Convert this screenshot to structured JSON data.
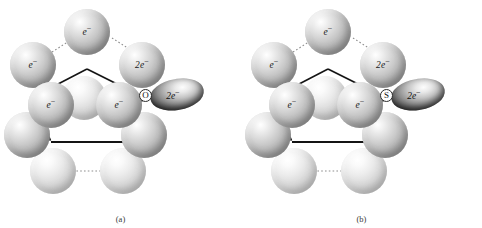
{
  "figure": {
    "panels": [
      {
        "id": "a",
        "caption": "(a)",
        "adsorbate_symbol": "O",
        "lobe_label": "2e",
        "lobe_charge": "−",
        "spheres": [
          {
            "name": "top",
            "label": "e",
            "charge": "−",
            "x": 64,
            "y": 9,
            "d": 46,
            "pale": false
          },
          {
            "name": "upper-left",
            "label": "e",
            "charge": "−",
            "x": 10,
            "y": 42,
            "d": 46,
            "pale": false
          },
          {
            "name": "upper-right",
            "label": "2e",
            "charge": "−",
            "x": 119,
            "y": 42,
            "d": 46,
            "pale": false
          },
          {
            "name": "inner-center",
            "label": "",
            "charge": "",
            "x": 62,
            "y": 76,
            "d": 44,
            "pale": true
          },
          {
            "name": "inner-left",
            "label": "e",
            "charge": "−",
            "x": 28,
            "y": 82,
            "d": 46,
            "pale": false
          },
          {
            "name": "inner-right",
            "label": "e",
            "charge": "−",
            "x": 96,
            "y": 82,
            "d": 46,
            "pale": false
          },
          {
            "name": "lower-left",
            "label": "",
            "charge": "",
            "x": 4,
            "y": 112,
            "d": 46,
            "pale": false
          },
          {
            "name": "lower-right",
            "label": "",
            "charge": "",
            "x": 121,
            "y": 112,
            "d": 46,
            "pale": false
          },
          {
            "name": "bottom-left",
            "label": "",
            "charge": "",
            "x": 30,
            "y": 148,
            "d": 46,
            "pale": true
          },
          {
            "name": "bottom-right",
            "label": "",
            "charge": "",
            "x": 100,
            "y": 148,
            "d": 46,
            "pale": true
          }
        ]
      },
      {
        "id": "b",
        "caption": "(b)",
        "adsorbate_symbol": "S",
        "lobe_label": "2e",
        "lobe_charge": "−",
        "spheres": [
          {
            "name": "top",
            "label": "e",
            "charge": "−",
            "x": 64,
            "y": 9,
            "d": 46,
            "pale": false
          },
          {
            "name": "upper-left",
            "label": "e",
            "charge": "−",
            "x": 10,
            "y": 42,
            "d": 46,
            "pale": false
          },
          {
            "name": "upper-right",
            "label": "2e",
            "charge": "−",
            "x": 119,
            "y": 42,
            "d": 46,
            "pale": false
          },
          {
            "name": "inner-center",
            "label": "",
            "charge": "",
            "x": 62,
            "y": 76,
            "d": 44,
            "pale": true
          },
          {
            "name": "inner-left",
            "label": "e",
            "charge": "−",
            "x": 28,
            "y": 82,
            "d": 46,
            "pale": false
          },
          {
            "name": "inner-right",
            "label": "e",
            "charge": "−",
            "x": 96,
            "y": 82,
            "d": 46,
            "pale": false
          },
          {
            "name": "lower-left",
            "label": "",
            "charge": "",
            "x": 4,
            "y": 112,
            "d": 46,
            "pale": false
          },
          {
            "name": "lower-right",
            "label": "",
            "charge": "",
            "x": 121,
            "y": 112,
            "d": 46,
            "pale": false
          },
          {
            "name": "bottom-left",
            "label": "",
            "charge": "",
            "x": 30,
            "y": 148,
            "d": 46,
            "pale": true
          },
          {
            "name": "bottom-right",
            "label": "",
            "charge": "",
            "x": 100,
            "y": 148,
            "d": 46,
            "pale": true
          }
        ]
      }
    ],
    "colors": {
      "outline": "#141414",
      "dotted_connector": "#8d8d8d",
      "lobe_dark": "#141414",
      "sphere_mid": "#c0c0c0"
    }
  }
}
